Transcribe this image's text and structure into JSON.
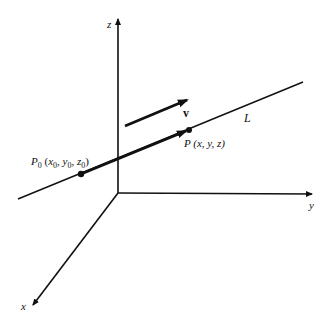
{
  "diagram": {
    "colors": {
      "ink": "#111111",
      "background": "#ffffff"
    },
    "axes": {
      "x": {
        "label": "x"
      },
      "y": {
        "label": "y"
      },
      "z": {
        "label": "z"
      }
    },
    "line": {
      "label": "L"
    },
    "vector": {
      "label": "v"
    },
    "points": {
      "p0": {
        "name": "P",
        "subscript": "0",
        "coords_text_open": " (x",
        "coords": [
          {
            "var": "x",
            "sub": "0",
            "sep": ", "
          },
          {
            "var": "y",
            "sub": "0",
            "sep": ", "
          },
          {
            "var": "z",
            "sub": "0",
            "sep": ")"
          }
        ]
      },
      "p": {
        "label": "P (x, y, z)"
      }
    },
    "p0_parts": {
      "P": "P",
      "P_sub": "0",
      "open": " (",
      "x": "x",
      "x_sub": "0",
      "c1": ", ",
      "y": "y",
      "y_sub": "0",
      "c2": ", ",
      "z": "z",
      "z_sub": "0",
      "close": ")"
    }
  }
}
